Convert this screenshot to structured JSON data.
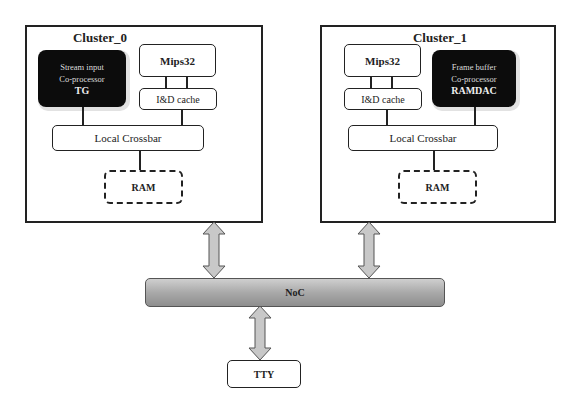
{
  "diagram": {
    "clusters": [
      {
        "title": "Cluster_0",
        "coprocessor": {
          "line1": "Stream input",
          "line2": "Co-processor",
          "name": "TG"
        },
        "cpu": "Mips32",
        "cache": "I&D cache",
        "crossbar": "Local Crossbar",
        "memory": "RAM"
      },
      {
        "title": "Cluster_1",
        "coprocessor": {
          "line1": "Frame buffer",
          "line2": "Co-processor",
          "name": "RAMDAC"
        },
        "cpu": "Mips32",
        "cache": "I&D cache",
        "crossbar": "Local Crossbar",
        "memory": "RAM"
      }
    ],
    "interconnect": "NoC",
    "peripheral": "TTY",
    "colors": {
      "line": "#222222",
      "coprocessor_fill": "#0c0c0c",
      "noc_fill": "#a9a9a9",
      "arrow_fill": "#c8c8c8"
    }
  }
}
